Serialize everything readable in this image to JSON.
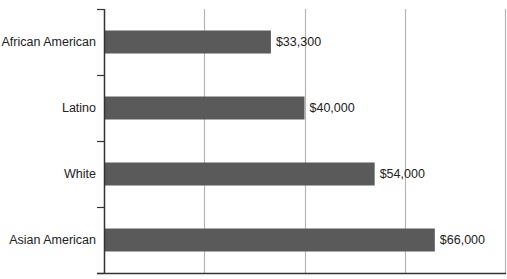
{
  "chart_data": {
    "type": "bar",
    "orientation": "horizontal",
    "title": "",
    "xlabel": "",
    "ylabel": "",
    "categories": [
      "African American",
      "Latino",
      "White",
      "Asian American"
    ],
    "values": [
      33300,
      40000,
      54000,
      66000
    ],
    "value_labels": [
      "$33,300",
      "$40,000",
      "$54,000",
      "$66,000"
    ],
    "xlim": [
      0,
      80000
    ],
    "x_gridlines": [
      20000,
      40000,
      60000,
      80000
    ],
    "x_tick_labels_shown": false,
    "grid": true,
    "legend": null,
    "bar_color": "#5a5a5a"
  },
  "colors": {
    "bar": "#5a5a5a",
    "axis": "#333333",
    "grid": "#b5b5b5",
    "text": "#222222"
  }
}
